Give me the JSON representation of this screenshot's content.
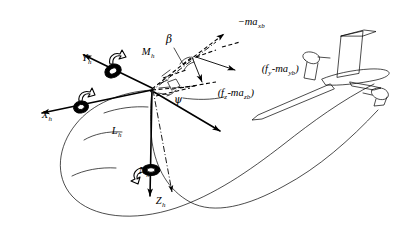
{
  "figure": {
    "background_color": "#ffffff",
    "ink_color": "#000000",
    "width": 399,
    "height": 234
  },
  "axes": [
    {
      "id": "y-axis",
      "label": "Y",
      "subscript": "h",
      "label_x": 60,
      "label_y": 60,
      "direction": "upper-left",
      "style": "solid-arrow"
    },
    {
      "id": "x-axis",
      "label": "X",
      "subscript": "h",
      "label_x": 20,
      "label_y": 117,
      "direction": "left",
      "style": "solid-arrow"
    },
    {
      "id": "z-axis",
      "label": "Z",
      "subscript": "h",
      "label_x": 134,
      "label_y": 202,
      "direction": "down",
      "style": "solid-arrow"
    }
  ],
  "moments": [
    {
      "id": "m-moment",
      "label": "M",
      "subscript": "h",
      "label_x": 119,
      "label_y": 54,
      "about_axis": "y-axis",
      "glyph": "curved-moment-arrow"
    },
    {
      "id": "l-moment",
      "label": "L",
      "subscript": "h",
      "label_x": 90,
      "label_y": 132,
      "about_axis": "x-axis",
      "glyph": "curved-moment-arrow"
    },
    {
      "id": "n-moment",
      "label": "N",
      "subscript": "h",
      "label_x": 117,
      "label_y": 172,
      "about_axis": "z-axis",
      "glyph": "curved-moment-arrow"
    }
  ],
  "forces": [
    {
      "id": "inertial-x-force",
      "text": "−ma",
      "subscript": "xb",
      "label_x": 216,
      "label_y": 24,
      "style": "dashed-arrow",
      "direction": "upper-right"
    },
    {
      "id": "lateral-force",
      "text": "(f",
      "sub1": "y",
      "mid": "-ma",
      "sub2": "yb",
      "close": ")",
      "full_text": "(f_y-ma_yb)",
      "label_x": 240,
      "label_y": 71,
      "style": "solid-arrow",
      "direction": "right-down"
    },
    {
      "id": "vertical-force",
      "text": "(f",
      "sub1": "z",
      "mid": "-ma",
      "sub2": "zb",
      "close": ")",
      "full_text": "(f_z-ma_zb)",
      "label_x": 196,
      "label_y": 95,
      "style": "solid-arrow",
      "direction": "down"
    }
  ],
  "angles": [
    {
      "id": "beta-angle",
      "symbol": "β",
      "label_x": 168,
      "label_y": 40,
      "description": "sideslip angle"
    },
    {
      "id": "psi-angle",
      "symbol": "ψ",
      "label_x": 176,
      "label_y": 101,
      "description": "yaw angle"
    }
  ],
  "objects": [
    {
      "id": "glider-aircraft",
      "name": "sailplane",
      "description": "T-tail sailplane towed at upper right"
    },
    {
      "id": "tow-cable",
      "name": "tow rope loop",
      "description": "long curved cable loop from origin to aircraft"
    }
  ],
  "origin": {
    "id": "hang-point-origin",
    "x": 152,
    "y": 88,
    "description": "hang point where axes and forces converge"
  }
}
